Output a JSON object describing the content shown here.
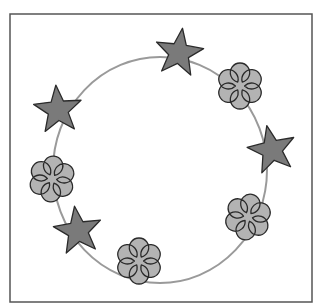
{
  "figure": {
    "frame": {
      "x": 10,
      "y": 14,
      "width": 302,
      "height": 288,
      "stroke": "#555555",
      "stroke_width": 1.5
    },
    "ring": {
      "cx": 160,
      "cy": 170,
      "rx": 107,
      "ry": 113,
      "stroke": "#9a9a9a",
      "stroke_width": 2
    },
    "colors": {
      "star_fill": "#7a7a7a",
      "flower_fill": "#b3b3b3",
      "outline": "#2a2a2a"
    },
    "items": [
      {
        "type": "star",
        "name": "star-top",
        "x": 179,
        "y": 53,
        "size": 25,
        "rotate": 8
      },
      {
        "type": "flower",
        "name": "flower-upper-right",
        "x": 240,
        "y": 86,
        "size": 23,
        "rotate": 0
      },
      {
        "type": "star",
        "name": "star-right",
        "x": 272,
        "y": 150,
        "size": 25,
        "rotate": -12
      },
      {
        "type": "flower",
        "name": "flower-lower-right",
        "x": 248,
        "y": 217,
        "size": 23,
        "rotate": 10
      },
      {
        "type": "flower",
        "name": "flower-bottom",
        "x": 139,
        "y": 261,
        "size": 23,
        "rotate": 0
      },
      {
        "type": "star",
        "name": "star-lower-left",
        "x": 78,
        "y": 231,
        "size": 25,
        "rotate": -8
      },
      {
        "type": "flower",
        "name": "flower-left",
        "x": 52,
        "y": 179,
        "size": 23,
        "rotate": 5
      },
      {
        "type": "star",
        "name": "star-upper-left",
        "x": 58,
        "y": 110,
        "size": 25,
        "rotate": -5
      }
    ]
  }
}
